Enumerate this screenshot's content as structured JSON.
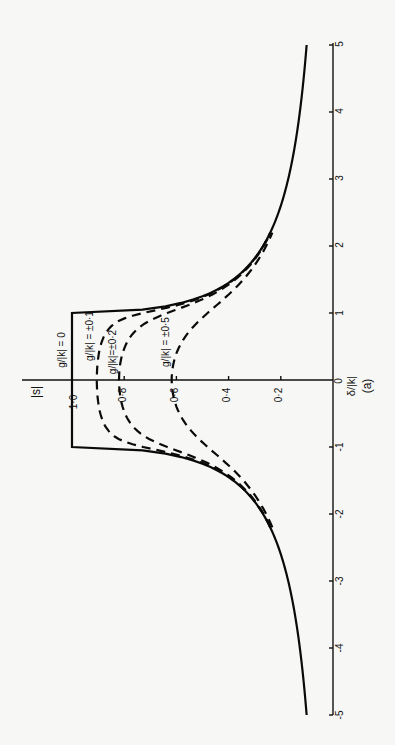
{
  "chart_data": {
    "type": "line",
    "orientation": "rotated 90 degrees (x-axis vertical, y-axis horizontal, text reads bottom-to-top)",
    "panel_label": "(a)",
    "xlabel": "δ/|k|",
    "ylabel": "|s|",
    "xlim": [
      -5,
      5
    ],
    "ylim": [
      0,
      1.0
    ],
    "x_ticks": [
      "-5",
      "-4",
      "-3",
      "-2",
      "-1",
      "0",
      "1",
      "2",
      "3",
      "4",
      "5"
    ],
    "y_ticks": [
      "0",
      "0·2",
      "0·4",
      "0·6",
      "0·8",
      "1·0"
    ],
    "grid": false,
    "legend": "inline curve labels",
    "series": [
      {
        "name": "g/|k| = 0",
        "style": "solid",
        "x": [
          -5,
          -4,
          -3,
          -2,
          -1.5,
          -1,
          -1,
          0,
          1,
          1,
          1.5,
          2,
          3,
          4,
          5
        ],
        "y": [
          0.1,
          0.13,
          0.17,
          0.27,
          0.38,
          1.0,
          1.0,
          1.0,
          1.0,
          1.0,
          0.38,
          0.27,
          0.17,
          0.13,
          0.1
        ]
      },
      {
        "name": "g/|k| = ±0·1",
        "style": "dashed",
        "x": [
          -2,
          -1.5,
          -1,
          -0.5,
          0,
          0.5,
          1,
          1.5,
          2
        ],
        "y": [
          0.27,
          0.38,
          0.73,
          0.87,
          0.9,
          0.87,
          0.73,
          0.38,
          0.27
        ]
      },
      {
        "name": "g/|k| = ±0·2",
        "style": "dashed",
        "x": [
          -2,
          -1.5,
          -1,
          -0.5,
          0,
          0.5,
          1,
          1.5,
          2
        ],
        "y": [
          0.27,
          0.37,
          0.61,
          0.77,
          0.82,
          0.77,
          0.61,
          0.37,
          0.27
        ]
      },
      {
        "name": "g/|k| = ±0·5",
        "style": "dashed",
        "x": [
          -2,
          -1.5,
          -1,
          -0.5,
          0,
          0.5,
          1,
          1.5,
          2
        ],
        "y": [
          0.25,
          0.32,
          0.41,
          0.53,
          0.62,
          0.53,
          0.41,
          0.32,
          0.25
        ]
      }
    ]
  },
  "labels": {
    "ylabel": "|s|",
    "xlabel": "δ/|k|",
    "panel": "(a)",
    "curve_g0": "g/|k| = 0",
    "curve_g01": "g/|k| = ±0·1",
    "curve_g02": "g/|k|=±0·2",
    "curve_g05": "g/|k| = ±0·5",
    "y_ticks": [
      "0·2",
      "0·4",
      "0·6",
      "0·8",
      "1·0"
    ],
    "y_tick_zero": "0",
    "x_ticks_pos": [
      "1",
      "2",
      "3",
      "4",
      "5"
    ],
    "x_ticks_neg": [
      "-1",
      "-2",
      "-3",
      "-4",
      "-5"
    ]
  }
}
